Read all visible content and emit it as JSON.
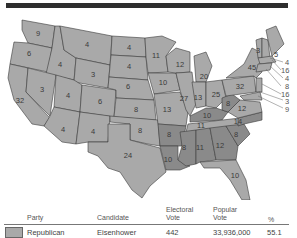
{
  "map": {
    "subject": "United States electoral map",
    "state_labels": [
      {
        "state": "WA",
        "value": "9"
      },
      {
        "state": "OR",
        "value": "6"
      },
      {
        "state": "CA",
        "value": "32"
      },
      {
        "state": "ID",
        "value": "4"
      },
      {
        "state": "NV",
        "value": "3"
      },
      {
        "state": "MT",
        "value": "4"
      },
      {
        "state": "WY",
        "value": "3"
      },
      {
        "state": "UT",
        "value": "4"
      },
      {
        "state": "AZ",
        "value": "4"
      },
      {
        "state": "CO",
        "value": "6"
      },
      {
        "state": "NM",
        "value": "4"
      },
      {
        "state": "ND",
        "value": "4"
      },
      {
        "state": "SD",
        "value": "4"
      },
      {
        "state": "NE",
        "value": "6"
      },
      {
        "state": "KS",
        "value": "8"
      },
      {
        "state": "OK",
        "value": "8"
      },
      {
        "state": "TX",
        "value": "24"
      },
      {
        "state": "MN",
        "value": "11"
      },
      {
        "state": "IA",
        "value": "10"
      },
      {
        "state": "MO",
        "value": "13"
      },
      {
        "state": "AR",
        "value": "8"
      },
      {
        "state": "LA",
        "value": "10"
      },
      {
        "state": "WI",
        "value": "12"
      },
      {
        "state": "IL",
        "value": "27"
      },
      {
        "state": "MI",
        "value": "20"
      },
      {
        "state": "IN",
        "value": "13"
      },
      {
        "state": "OH",
        "value": "25"
      },
      {
        "state": "KY",
        "value": "10"
      },
      {
        "state": "TN",
        "value": "11"
      },
      {
        "state": "MS",
        "value": "8"
      },
      {
        "state": "AL",
        "value": "11"
      },
      {
        "state": "GA",
        "value": "12"
      },
      {
        "state": "FL",
        "value": "10"
      },
      {
        "state": "SC",
        "value": "8"
      },
      {
        "state": "NC",
        "value": "14"
      },
      {
        "state": "VA",
        "value": "12"
      },
      {
        "state": "WV",
        "value": "8"
      },
      {
        "state": "PA",
        "value": "32"
      },
      {
        "state": "NY",
        "value": "45"
      },
      {
        "state": "VT",
        "value": "3"
      },
      {
        "state": "ME",
        "value": "5"
      }
    ],
    "callouts": [
      {
        "state": "NH",
        "value": "4"
      },
      {
        "state": "MA",
        "value": "16"
      },
      {
        "state": "RI",
        "value": "4"
      },
      {
        "state": "CT",
        "value": "8"
      },
      {
        "state": "NJ",
        "value": "16"
      },
      {
        "state": "DE",
        "value": "3"
      },
      {
        "state": "MD",
        "value": "9"
      }
    ]
  },
  "legend": {
    "headers": {
      "party": "Party",
      "candidate": "Candidate",
      "electoral_l1": "Electoral",
      "electoral_l2": "Vote",
      "popular_l1": "Popular",
      "popular_l2": "Vote",
      "percent": "%"
    },
    "rows": [
      {
        "party": "Republican",
        "candidate": "Eisenhower",
        "electoral_vote": "442",
        "popular_vote": "33,936,000",
        "percent": "55.1",
        "color": "#a9a9a9"
      }
    ]
  }
}
